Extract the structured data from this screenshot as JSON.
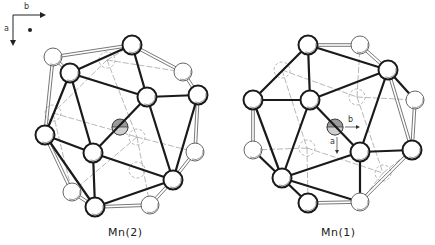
{
  "figure": {
    "axis_key": {
      "horizontal_label": "b",
      "vertical_label": "a",
      "marker": "dot"
    },
    "structures": [
      {
        "id": "mn2",
        "caption": "Mn(2)",
        "center": [
          120,
          127
        ],
        "atoms_front": [
          [
            132,
            45
          ],
          [
            70,
            73
          ],
          [
            147,
            97
          ],
          [
            198,
            95
          ],
          [
            93,
            153
          ],
          [
            173,
            180
          ],
          [
            95,
            207
          ],
          [
            45,
            135
          ]
        ],
        "atoms_light": [
          [
            53,
            57
          ],
          [
            183,
            72
          ],
          [
            195,
            152
          ],
          [
            72,
            192
          ],
          [
            150,
            205
          ]
        ],
        "atoms_hidden": [
          [
            107,
            60
          ],
          [
            53,
            113
          ],
          [
            137,
            137
          ],
          [
            137,
            170
          ]
        ],
        "bonds_bold": [
          [
            132,
            45,
            70,
            73
          ],
          [
            132,
            45,
            147,
            97
          ],
          [
            70,
            73,
            147,
            97
          ],
          [
            70,
            73,
            93,
            153
          ],
          [
            147,
            97,
            93,
            153
          ],
          [
            147,
            97,
            198,
            95
          ],
          [
            147,
            97,
            173,
            180
          ],
          [
            93,
            153,
            173,
            180
          ],
          [
            93,
            153,
            95,
            207
          ],
          [
            93,
            153,
            45,
            135
          ],
          [
            45,
            135,
            70,
            73
          ],
          [
            198,
            95,
            173,
            180
          ],
          [
            173,
            180,
            95,
            207
          ],
          [
            45,
            135,
            95,
            207
          ]
        ],
        "bonds_double": [
          [
            132,
            45,
            53,
            57
          ],
          [
            132,
            45,
            183,
            72
          ],
          [
            183,
            72,
            198,
            95
          ],
          [
            53,
            57,
            70,
            73
          ],
          [
            53,
            57,
            45,
            135
          ],
          [
            198,
            95,
            195,
            152
          ],
          [
            195,
            152,
            173,
            180
          ],
          [
            45,
            135,
            72,
            192
          ],
          [
            72,
            192,
            95,
            207
          ],
          [
            95,
            207,
            150,
            205
          ],
          [
            150,
            205,
            173,
            180
          ]
        ],
        "bonds_thin": [
          [
            107,
            60,
            53,
            113
          ],
          [
            107,
            60,
            137,
            137
          ],
          [
            107,
            60,
            183,
            72
          ],
          [
            53,
            113,
            137,
            137
          ],
          [
            53,
            113,
            72,
            192
          ],
          [
            137,
            137,
            195,
            152
          ],
          [
            137,
            137,
            150,
            205
          ],
          [
            137,
            137,
            72,
            192
          ],
          [
            53,
            113,
            45,
            135
          ],
          [
            107,
            60,
            132,
            45
          ]
        ]
      },
      {
        "id": "mn1",
        "caption": "Mn(1)",
        "center": [
          335,
          127
        ],
        "inner_axis": {
          "b_label": "b",
          "a_label": "a"
        },
        "atoms_front": [
          [
            308,
            45
          ],
          [
            388,
            70
          ],
          [
            310,
            100
          ],
          [
            253,
            100
          ],
          [
            360,
            152
          ],
          [
            282,
            178
          ],
          [
            308,
            203
          ],
          [
            412,
            150
          ]
        ],
        "atoms_light": [
          [
            360,
            45
          ],
          [
            415,
            100
          ],
          [
            253,
            150
          ],
          [
            360,
            202
          ]
        ],
        "atoms_hidden": [
          [
            282,
            70
          ],
          [
            357,
            97
          ],
          [
            307,
            148
          ],
          [
            383,
            173
          ]
        ],
        "bonds_bold": [
          [
            308,
            45,
            253,
            100
          ],
          [
            308,
            45,
            310,
            100
          ],
          [
            310,
            100,
            253,
            100
          ],
          [
            310,
            100,
            388,
            70
          ],
          [
            310,
            100,
            282,
            178
          ],
          [
            310,
            100,
            360,
            152
          ],
          [
            388,
            70,
            360,
            152
          ],
          [
            388,
            70,
            415,
            100
          ],
          [
            360,
            152,
            412,
            150
          ],
          [
            360,
            152,
            282,
            178
          ],
          [
            360,
            152,
            360,
            202
          ],
          [
            282,
            178,
            253,
            150
          ],
          [
            282,
            178,
            308,
            203
          ],
          [
            282,
            178,
            360,
            202
          ],
          [
            308,
            45,
            388,
            70
          ],
          [
            253,
            100,
            282,
            178
          ]
        ],
        "bonds_double": [
          [
            308,
            45,
            360,
            45
          ],
          [
            360,
            45,
            388,
            70
          ],
          [
            415,
            100,
            412,
            150
          ],
          [
            412,
            150,
            360,
            202
          ],
          [
            253,
            100,
            253,
            150
          ],
          [
            308,
            203,
            360,
            202
          ],
          [
            388,
            70,
            412,
            150
          ]
        ],
        "bonds_thin": [
          [
            282,
            70,
            357,
            97
          ],
          [
            282,
            70,
            307,
            148
          ],
          [
            282,
            70,
            253,
            100
          ],
          [
            282,
            70,
            308,
            45
          ],
          [
            357,
            97,
            383,
            173
          ],
          [
            357,
            97,
            415,
            100
          ],
          [
            307,
            148,
            383,
            173
          ],
          [
            307,
            148,
            253,
            150
          ],
          [
            307,
            148,
            308,
            203
          ],
          [
            383,
            173,
            412,
            150
          ],
          [
            383,
            173,
            360,
            202
          ],
          [
            357,
            97,
            360,
            45
          ]
        ]
      }
    ]
  },
  "colors": {
    "ink": "#1a1a1a",
    "light_ink": "#555555",
    "hidden_ink": "#888888",
    "center_fill": "#9a9a9a",
    "atom_fill": "#ffffff"
  }
}
